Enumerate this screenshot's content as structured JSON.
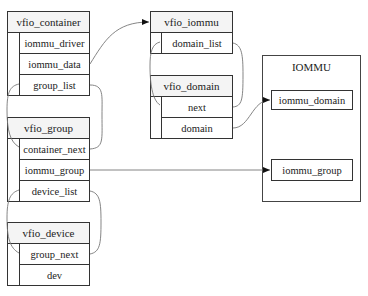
{
  "structs": {
    "vfio_container": {
      "title": "vfio_container",
      "fields": [
        "iommu_driver",
        "iommu_data",
        "group_list"
      ]
    },
    "vfio_group": {
      "title": "vfio_group",
      "fields": [
        "container_next",
        "iommu_group",
        "device_list"
      ]
    },
    "vfio_device": {
      "title": "vfio_device",
      "fields": [
        "group_next",
        "dev"
      ]
    },
    "vfio_iommu": {
      "title": "vfio_iommu",
      "fields": [
        "domain_list"
      ]
    },
    "vfio_domain": {
      "title": "vfio_domain",
      "fields": [
        "next",
        "domain"
      ]
    }
  },
  "iommu": {
    "title": "IOMMU",
    "items": [
      "iommu_domain",
      "iommu_group"
    ]
  },
  "links": [
    {
      "from": "vfio_container.iommu_data",
      "to": "vfio_iommu",
      "arrow": true
    },
    {
      "from": "vfio_container.group_list",
      "to": "vfio_group.container_next",
      "arrow": false
    },
    {
      "from": "vfio_iommu.domain_list",
      "to": "vfio_domain.next",
      "arrow": false
    },
    {
      "from": "vfio_domain.domain",
      "to": "IOMMU.iommu_domain",
      "arrow": true
    },
    {
      "from": "vfio_group.iommu_group",
      "to": "IOMMU.iommu_group",
      "arrow": true
    },
    {
      "from": "vfio_group.device_list",
      "to": "vfio_device.group_next",
      "arrow": false
    }
  ],
  "colors": {
    "border": "#333333",
    "header_bg": "#f4f4f4",
    "link": "#777777"
  }
}
